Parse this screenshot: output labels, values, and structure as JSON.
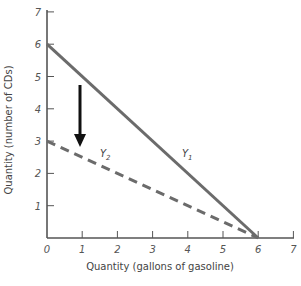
{
  "chart_data": {
    "type": "line",
    "title": "",
    "xlabel": "Quantity (gallons of gasoline)",
    "ylabel": "Quantity (number of CDs)",
    "xlim": [
      0,
      7
    ],
    "ylim": [
      0,
      7
    ],
    "x_ticks": [
      "0",
      "1",
      "2",
      "3",
      "4",
      "5",
      "6",
      "7"
    ],
    "y_ticks": [
      "1",
      "2",
      "3",
      "4",
      "5",
      "6",
      "7"
    ],
    "grid": false,
    "series": [
      {
        "name": "Y1",
        "label_main": "Y",
        "label_sub": "1",
        "style": "solid",
        "color": "#6b6b6b",
        "points": [
          [
            0,
            6
          ],
          [
            6,
            0
          ]
        ]
      },
      {
        "name": "Y2",
        "label_main": "Y",
        "label_sub": "2",
        "style": "dashed",
        "color": "#6b6b6b",
        "points": [
          [
            0,
            3
          ],
          [
            6,
            0
          ]
        ]
      }
    ],
    "annotations": [
      {
        "type": "arrow",
        "direction": "down",
        "from": [
          1,
          4.7
        ],
        "to": [
          1,
          2.9
        ],
        "color": "#111111"
      }
    ]
  }
}
